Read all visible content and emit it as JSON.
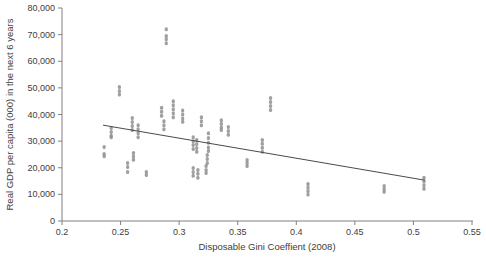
{
  "chart_data": {
    "type": "scatter",
    "title": "",
    "xlabel": "Disposable Gini Coeffient (2008)",
    "ylabel": "Real GDP per capita (000) in the next 6 years",
    "xlim": [
      0.2,
      0.55
    ],
    "ylim": [
      0,
      80000
    ],
    "grid": false,
    "legend": false,
    "x_ticks": [
      {
        "value": 0.2,
        "label": "0.2"
      },
      {
        "value": 0.25,
        "label": "0.25"
      },
      {
        "value": 0.3,
        "label": "0.3"
      },
      {
        "value": 0.35,
        "label": "0.35"
      },
      {
        "value": 0.4,
        "label": "0.4"
      },
      {
        "value": 0.45,
        "label": "0.45"
      },
      {
        "value": 0.5,
        "label": "0.5"
      },
      {
        "value": 0.55,
        "label": "0.55"
      }
    ],
    "y_ticks": [
      {
        "value": 0,
        "label": "0"
      },
      {
        "value": 10000,
        "label": "10,000"
      },
      {
        "value": 20000,
        "label": "20,000"
      },
      {
        "value": 30000,
        "label": "30,000"
      },
      {
        "value": 40000,
        "label": "40,000"
      },
      {
        "value": 50000,
        "label": "50,000"
      },
      {
        "value": 60000,
        "label": "60,000"
      },
      {
        "value": 70000,
        "label": "70,000"
      },
      {
        "value": 80000,
        "label": "80,000"
      }
    ],
    "colors": {
      "marker": "#8f8f8f",
      "axis": "#808080",
      "text": "#404040",
      "trendline": "#4a4a4a",
      "background": "#ffffff"
    },
    "trendline": {
      "x1": 0.235,
      "y1": 36000,
      "x2": 0.51,
      "y2": 15300
    },
    "series": [
      {
        "name": "country-year observations",
        "clusters": [
          {
            "x": 0.236,
            "ys": [
              27800,
              25200,
              24300
            ]
          },
          {
            "x": 0.242,
            "ys": [
              34900,
              33400,
              32000,
              31500
            ]
          },
          {
            "x": 0.249,
            "ys": [
              50300,
              48800,
              47500
            ]
          },
          {
            "x": 0.256,
            "ys": [
              21800,
              20300,
              18400
            ]
          },
          {
            "x": 0.26,
            "ys": [
              38700,
              37200,
              35700,
              34200
            ]
          },
          {
            "x": 0.261,
            "ys": [
              25500,
              24200,
              23000
            ]
          },
          {
            "x": 0.265,
            "ys": [
              36000,
              34500,
              33000,
              31500
            ]
          },
          {
            "x": 0.272,
            "ys": [
              18400,
              17300
            ]
          },
          {
            "x": 0.285,
            "ys": [
              42500,
              41000,
              39500
            ]
          },
          {
            "x": 0.287,
            "ys": [
              37500,
              36000,
              34500
            ]
          },
          {
            "x": 0.289,
            "ys": [
              72000,
              69500,
              68300,
              66800
            ]
          },
          {
            "x": 0.295,
            "ys": [
              45000,
              43500,
              42000,
              40500,
              39000
            ]
          },
          {
            "x": 0.303,
            "ys": [
              41500,
              40000,
              38500,
              37300
            ]
          },
          {
            "x": 0.312,
            "ys": [
              31500,
              30000,
              28500,
              27000
            ]
          },
          {
            "x": 0.315,
            "ys": [
              30400,
              28900,
              27400,
              26000
            ]
          },
          {
            "x": 0.312,
            "ys": [
              19900,
              18400,
              17000
            ]
          },
          {
            "x": 0.316,
            "ys": [
              19200,
              17700,
              16200
            ]
          },
          {
            "x": 0.319,
            "ys": [
              39000,
              37500,
              36000
            ]
          },
          {
            "x": 0.325,
            "ys": [
              33000,
              31200,
              29400,
              27600,
              26300
            ]
          },
          {
            "x": 0.324,
            "ys": [
              24800,
              23300,
              21800
            ]
          },
          {
            "x": 0.323,
            "ys": [
              20700,
              19200,
              18000
            ]
          },
          {
            "x": 0.336,
            "ys": [
              37800,
              36500,
              35200,
              34200
            ]
          },
          {
            "x": 0.342,
            "ys": [
              35300,
              33800,
              32400
            ]
          },
          {
            "x": 0.358,
            "ys": [
              22900,
              21800,
              20700
            ]
          },
          {
            "x": 0.371,
            "ys": [
              30400,
              29000,
              27500,
              26000
            ]
          },
          {
            "x": 0.378,
            "ys": [
              46200,
              44700,
              43200,
              41700
            ]
          },
          {
            "x": 0.41,
            "ys": [
              13900,
              12600,
              11300,
              10000
            ]
          },
          {
            "x": 0.475,
            "ys": [
              13100,
              12000,
              11000
            ]
          },
          {
            "x": 0.509,
            "ys": [
              16200,
              14800,
              13400,
              12100
            ]
          }
        ]
      }
    ]
  }
}
